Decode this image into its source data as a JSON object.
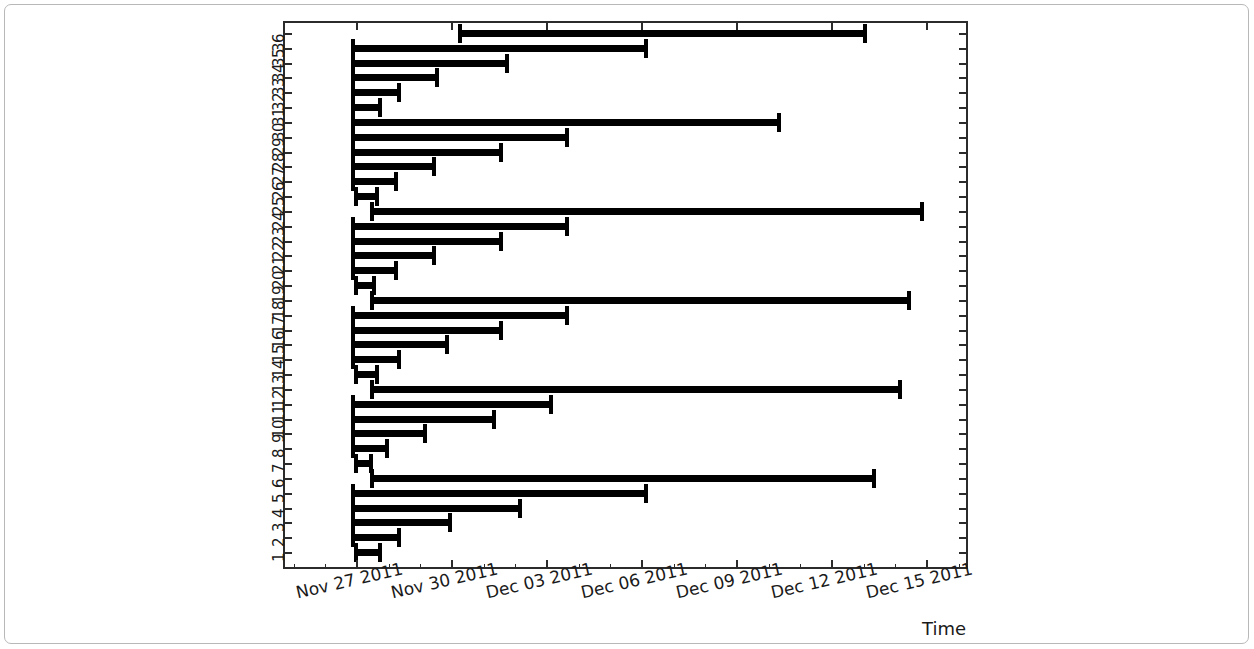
{
  "chart_data": {
    "type": "bar",
    "orientation": "horizontal",
    "title": "",
    "xlabel": "Time",
    "ylabel": "",
    "grid": false,
    "legend": null,
    "x_axis": {
      "type": "datetime",
      "tick_labels": [
        "Nov 27 2011",
        "Nov 30 2011",
        "Dec 03 2011",
        "Dec 06 2011",
        "Dec 09 2011",
        "Dec 12 2011",
        "Dec 15 2011"
      ],
      "tick_values": [
        "2011-11-27",
        "2011-11-30",
        "2011-12-03",
        "2011-12-06",
        "2011-12-09",
        "2011-12-12",
        "2011-12-15"
      ],
      "xlim": [
        "2011-11-25.1",
        "2011-12-16.7"
      ],
      "days_per_tick": 3
    },
    "y_axis": {
      "tick_labels": [
        "36",
        "35",
        "34",
        "33",
        "32",
        "31",
        "30",
        "29",
        "28",
        "27",
        "26",
        "25",
        "24",
        "23",
        "22",
        "21",
        "20",
        "19",
        "18",
        "17",
        "16",
        "15",
        "14",
        "13",
        "12",
        "11",
        "10",
        "9",
        "8",
        "7",
        "6",
        "5",
        "4",
        "3",
        "2",
        "1"
      ],
      "ylim": [
        0.5,
        36.5
      ],
      "order": "descending-top-to-bottom"
    },
    "categories": [
      1,
      2,
      3,
      4,
      5,
      6,
      7,
      8,
      9,
      10,
      11,
      12,
      13,
      14,
      15,
      16,
      17,
      18,
      19,
      20,
      21,
      22,
      23,
      24,
      25,
      26,
      27,
      28,
      29,
      30,
      31,
      32,
      33,
      34,
      35,
      36
    ],
    "bars": [
      {
        "id": 1,
        "start_day": 1.9,
        "end_day": 2.8,
        "start_date": "2011-11-26.9",
        "end_date": "2011-11-27.8"
      },
      {
        "id": 2,
        "start_day": 1.8,
        "end_day": 3.4,
        "start_date": "2011-11-26.8",
        "end_date": "2011-11-28.4"
      },
      {
        "id": 3,
        "start_day": 1.8,
        "end_day": 5.0,
        "start_date": "2011-11-26.8",
        "end_date": "2011-11-30.0"
      },
      {
        "id": 4,
        "start_day": 1.8,
        "end_day": 7.2,
        "start_date": "2011-11-26.8",
        "end_date": "2011-12-02.2"
      },
      {
        "id": 5,
        "start_day": 1.8,
        "end_day": 11.2,
        "start_date": "2011-11-26.8",
        "end_date": "2011-12-06.2"
      },
      {
        "id": 6,
        "start_day": 2.4,
        "end_day": 18.4,
        "start_date": "2011-11-27.4",
        "end_date": "2011-12-13.4"
      },
      {
        "id": 7,
        "start_day": 1.9,
        "end_day": 2.5,
        "start_date": "2011-11-26.9",
        "end_date": "2011-11-27.5"
      },
      {
        "id": 8,
        "start_day": 1.8,
        "end_day": 3.0,
        "start_date": "2011-11-26.8",
        "end_date": "2011-11-28.0"
      },
      {
        "id": 9,
        "start_day": 1.8,
        "end_day": 4.2,
        "start_date": "2011-11-26.8",
        "end_date": "2011-11-29.2"
      },
      {
        "id": 10,
        "start_day": 1.8,
        "end_day": 6.4,
        "start_date": "2011-11-26.8",
        "end_date": "2011-12-01.4"
      },
      {
        "id": 11,
        "start_day": 1.8,
        "end_day": 8.2,
        "start_date": "2011-11-26.8",
        "end_date": "2011-12-03.2"
      },
      {
        "id": 12,
        "start_day": 2.4,
        "end_day": 19.2,
        "start_date": "2011-11-27.4",
        "end_date": "2011-12-14.2"
      },
      {
        "id": 13,
        "start_day": 1.9,
        "end_day": 2.7,
        "start_date": "2011-11-26.9",
        "end_date": "2011-11-27.7"
      },
      {
        "id": 14,
        "start_day": 1.8,
        "end_day": 3.4,
        "start_date": "2011-11-26.8",
        "end_date": "2011-11-28.4"
      },
      {
        "id": 15,
        "start_day": 1.8,
        "end_day": 4.9,
        "start_date": "2011-11-26.8",
        "end_date": "2011-11-29.9"
      },
      {
        "id": 16,
        "start_day": 1.8,
        "end_day": 6.6,
        "start_date": "2011-11-26.8",
        "end_date": "2011-12-01.6"
      },
      {
        "id": 17,
        "start_day": 1.8,
        "end_day": 8.7,
        "start_date": "2011-11-26.8",
        "end_date": "2011-12-03.7"
      },
      {
        "id": 18,
        "start_day": 2.4,
        "end_day": 19.5,
        "start_date": "2011-11-27.4",
        "end_date": "2011-12-14.5"
      },
      {
        "id": 19,
        "start_day": 1.9,
        "end_day": 2.6,
        "start_date": "2011-11-26.9",
        "end_date": "2011-11-27.6"
      },
      {
        "id": 20,
        "start_day": 1.8,
        "end_day": 3.3,
        "start_date": "2011-11-26.8",
        "end_date": "2011-11-28.3"
      },
      {
        "id": 21,
        "start_day": 1.8,
        "end_day": 4.5,
        "start_date": "2011-11-26.8",
        "end_date": "2011-11-29.5"
      },
      {
        "id": 22,
        "start_day": 1.8,
        "end_day": 6.6,
        "start_date": "2011-11-26.8",
        "end_date": "2011-12-01.6"
      },
      {
        "id": 23,
        "start_day": 1.8,
        "end_day": 8.7,
        "start_date": "2011-11-26.8",
        "end_date": "2011-12-03.7"
      },
      {
        "id": 24,
        "start_day": 2.4,
        "end_day": 19.9,
        "start_date": "2011-11-27.4",
        "end_date": "2011-12-14.9"
      },
      {
        "id": 25,
        "start_day": 1.9,
        "end_day": 2.7,
        "start_date": "2011-11-26.9",
        "end_date": "2011-11-27.7"
      },
      {
        "id": 26,
        "start_day": 1.8,
        "end_day": 3.3,
        "start_date": "2011-11-26.8",
        "end_date": "2011-11-28.3"
      },
      {
        "id": 27,
        "start_day": 1.8,
        "end_day": 4.5,
        "start_date": "2011-11-26.8",
        "end_date": "2011-11-29.5"
      },
      {
        "id": 28,
        "start_day": 1.8,
        "end_day": 6.6,
        "start_date": "2011-11-26.8",
        "end_date": "2011-12-01.6"
      },
      {
        "id": 29,
        "start_day": 1.8,
        "end_day": 8.7,
        "start_date": "2011-11-26.8",
        "end_date": "2011-12-03.7"
      },
      {
        "id": 30,
        "start_day": 1.8,
        "end_day": 15.4,
        "start_date": "2011-11-26.8",
        "end_date": "2011-12-10.4"
      },
      {
        "id": 31,
        "start_day": 1.8,
        "end_day": 2.8,
        "start_date": "2011-11-26.8",
        "end_date": "2011-11-27.8"
      },
      {
        "id": 32,
        "start_day": 1.8,
        "end_day": 3.4,
        "start_date": "2011-11-26.8",
        "end_date": "2011-11-28.4"
      },
      {
        "id": 33,
        "start_day": 1.8,
        "end_day": 4.6,
        "start_date": "2011-11-26.8",
        "end_date": "2011-11-29.6"
      },
      {
        "id": 34,
        "start_day": 1.8,
        "end_day": 6.8,
        "start_date": "2011-11-26.8",
        "end_date": "2011-12-01.8"
      },
      {
        "id": 35,
        "start_day": 1.8,
        "end_day": 11.2,
        "start_date": "2011-11-26.8",
        "end_date": "2011-12-06.2"
      },
      {
        "id": 36,
        "start_day": 5.2,
        "end_day": 18.1,
        "start_date": "2011-11-30.2",
        "end_date": "2011-12-13.1"
      }
    ],
    "style": {
      "bar_color": "#000000",
      "axis_color": "#2b2b2b",
      "background": "#ffffff",
      "cap_style": "I-beam"
    }
  },
  "figure": {
    "axis_title": "Time"
  }
}
